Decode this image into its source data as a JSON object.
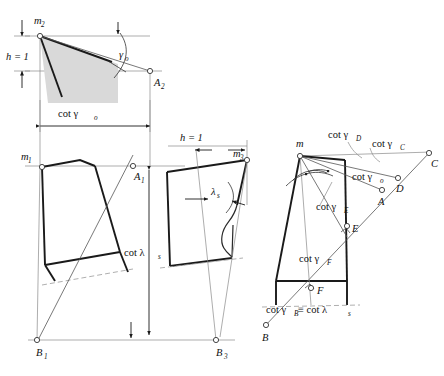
{
  "figure": {
    "background_color": "#ffffff",
    "line_color": "#1a1a1a",
    "thin_line_color": "#8a8a8a",
    "shade_color": "#d9d9d9"
  },
  "panel_top_left": {
    "name": "top-left-construction",
    "labels": {
      "vertex_m2": "m",
      "vertex_m2_sub": "2",
      "height": "h = 1",
      "angle_gamma0": "γ",
      "angle_gamma0_sub": "o",
      "cot_gamma0": "cot γ",
      "cot_gamma0_sub": "o",
      "point_A2": "A",
      "point_A2_sub": "2"
    }
  },
  "panel_bottom_left": {
    "name": "bottom-left-construction",
    "labels": {
      "vertex_m1": "m",
      "vertex_m1_sub": "1",
      "point_A1": "A",
      "point_A1_sub": "1",
      "point_B1": "B",
      "point_B1_sub": "1",
      "cot_lambda_s": "cot λ",
      "cot_lambda_s_sub": "s"
    }
  },
  "panel_middle": {
    "name": "middle-construction",
    "labels": {
      "height": "h = 1",
      "vertex_m3": "m",
      "vertex_m3_sub": "3",
      "angle_lambda_s": "λ",
      "angle_lambda_s_sub": "s",
      "point_B3": "B",
      "point_B3_sub": "3"
    }
  },
  "panel_right": {
    "name": "right-construction",
    "labels": {
      "vertex_m": "m",
      "cot_gamma_D": "cot γ",
      "cot_gamma_D_sub": "D",
      "cot_gamma_C": "cot γ",
      "cot_gamma_C_sub": "C",
      "cot_gamma_o": "cot γ",
      "cot_gamma_o_sub": "o",
      "cot_gamma_E": "cot γ",
      "cot_gamma_E_sub": "E",
      "cot_gamma_F": "cot γ",
      "cot_gamma_F_sub": "F",
      "cot_gamma_B_eq": "cot γ",
      "cot_gamma_B_sub": "B",
      "cot_gamma_B_tail": " ≡ cot λ",
      "cot_gamma_B_tail_sub": "s",
      "point_C": "C",
      "point_D": "D",
      "point_A": "A",
      "point_E": "E",
      "point_F": "F",
      "point_B": "B"
    }
  }
}
